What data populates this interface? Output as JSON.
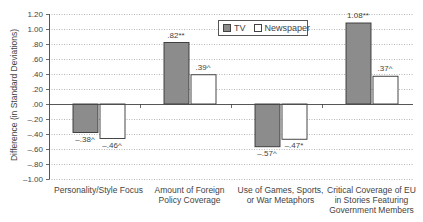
{
  "chart_data": {
    "type": "bar",
    "title": "",
    "xlabel": "",
    "ylabel": "Difference (in Standard Deviations)",
    "ylim": [
      -1.0,
      1.2
    ],
    "yticks": [
      "1.20",
      "1.00",
      ".80",
      ".60",
      ".40",
      ".20",
      ".00",
      "–.20",
      "–.40",
      "–.60",
      "–.80",
      "–1.00"
    ],
    "ytick_values": [
      1.2,
      1.0,
      0.8,
      0.6,
      0.4,
      0.2,
      0.0,
      -0.2,
      -0.4,
      -0.6,
      -0.8,
      -1.0
    ],
    "grid": "horizontal dotted",
    "legend_position": "top-right inside plot",
    "categories": [
      "Personality/Style Focus",
      "Amount of Foreign Policy Coverage",
      "Use of Games, Sports, or War Metaphors",
      "Critical Coverage of EU in Stories Featuring Government Members"
    ],
    "category_lines": [
      [
        "Personality/Style Focus"
      ],
      [
        "Amount of Foreign",
        "Policy Coverage"
      ],
      [
        "Use of Games, Sports,",
        "or War Metaphors"
      ],
      [
        "Critical Coverage of EU",
        "in Stories Featuring",
        "Government Members"
      ]
    ],
    "series": [
      {
        "name": "TV",
        "color": "#8c8c8c",
        "values": [
          -0.38,
          0.82,
          -0.57,
          1.08
        ],
        "labels": [
          "–.38^",
          ".82**",
          "–.57^",
          "1.08**"
        ]
      },
      {
        "name": "Newspaper",
        "color": "#ffffff",
        "values": [
          -0.46,
          0.39,
          -0.47,
          0.37
        ],
        "labels": [
          "–.46^",
          ".39^",
          "–.47*",
          ".37^"
        ]
      }
    ]
  },
  "legend": {
    "tv_label": "TV",
    "newspaper_label": "Newspaper"
  }
}
